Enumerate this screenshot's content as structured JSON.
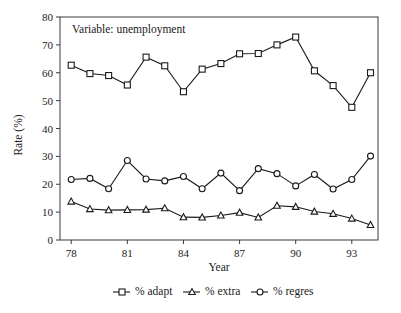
{
  "chart_data": {
    "type": "line",
    "title": "",
    "annotation": "Variable: unemployment",
    "xlabel": "Year",
    "ylabel": "Rate (%)",
    "xlim": [
      77.4,
      94.4
    ],
    "ylim": [
      0,
      80
    ],
    "grid": false,
    "legend_position": "bottom",
    "x": [
      78,
      79,
      80,
      81,
      82,
      83,
      84,
      85,
      86,
      87,
      88,
      89,
      90,
      91,
      92,
      93,
      94
    ],
    "xtick_labels": [
      "78",
      "81",
      "84",
      "87",
      "90",
      "93"
    ],
    "xtick_values": [
      78,
      81,
      84,
      87,
      90,
      93
    ],
    "ytick_labels": [
      "0",
      "10",
      "20",
      "30",
      "40",
      "50",
      "60",
      "70",
      "80"
    ],
    "ytick_values": [
      0,
      10,
      20,
      30,
      40,
      50,
      60,
      70,
      80
    ],
    "series": [
      {
        "name": "% adapt",
        "marker": "square",
        "values": [
          62.7,
          59.7,
          59.0,
          55.6,
          65.6,
          62.5,
          53.2,
          61.3,
          63.3,
          66.8,
          66.9,
          70.0,
          72.8,
          60.7,
          55.4,
          47.6,
          60.0
        ]
      },
      {
        "name": "% extra",
        "marker": "triangle",
        "values": [
          13.8,
          11.1,
          10.7,
          10.8,
          10.9,
          11.4,
          8.2,
          8.1,
          8.8,
          9.8,
          8.1,
          12.3,
          11.9,
          10.2,
          9.4,
          7.7,
          5.4
        ]
      },
      {
        "name": "% regres",
        "marker": "circle",
        "values": [
          21.7,
          22.1,
          18.4,
          28.5,
          21.9,
          21.2,
          22.8,
          18.4,
          24.0,
          17.7,
          25.6,
          23.8,
          19.4,
          23.5,
          18.3,
          21.7,
          30.1
        ]
      }
    ]
  },
  "legend": {
    "items": [
      {
        "label": "% adapt",
        "marker": "square"
      },
      {
        "label": "% extra",
        "marker": "triangle"
      },
      {
        "label": "% regres",
        "marker": "circle"
      }
    ]
  },
  "colors": {
    "ink": "#1a1a1a",
    "axis": "#3a3a3a",
    "background": "#ffffff",
    "marker_fill": "#ffffff"
  }
}
